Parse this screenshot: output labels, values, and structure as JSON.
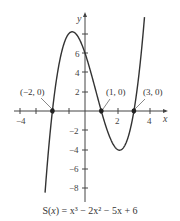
{
  "chart_data": {
    "type": "line",
    "title": "S(x) = x³ − 2x² − 5x + 6",
    "function": "x^3 - 2x^2 - 5x + 6",
    "xlabel": "x",
    "ylabel": "y",
    "xlim": [
      -4.3,
      4.8
    ],
    "ylim": [
      -9.5,
      9.8
    ],
    "x_ticks": [
      -4,
      -3,
      -2,
      -1,
      1,
      2,
      3,
      4
    ],
    "x_tick_labels": [
      "-4",
      "2",
      "4"
    ],
    "y_ticks": [
      -8,
      -6,
      -4,
      -2,
      2,
      4,
      6,
      8
    ],
    "y_tick_labels": [
      "-8",
      "-6",
      "-4",
      "-2",
      "2",
      "4",
      "6"
    ],
    "grid": false,
    "annotated_points": [
      {
        "label": "(−2, 0)",
        "x": -2,
        "y": 0
      },
      {
        "label": "(1, 0)",
        "x": 1,
        "y": 0
      },
      {
        "label": "(3, 0)",
        "x": 3,
        "y": 0
      }
    ],
    "series": [
      {
        "name": "S(x)",
        "x": [
          -2.3,
          -2,
          -1.5,
          -1,
          -0.79,
          -0.5,
          0,
          0.5,
          1,
          1.5,
          2,
          2.12,
          2.5,
          3,
          3.5,
          3.9
        ],
        "y": [
          -4.6,
          0,
          5.6,
          8.0,
          8.2,
          7.9,
          6.0,
          3.1,
          0,
          -2.6,
          -4.0,
          -4.1,
          -3.4,
          0,
          6.9,
          15.0
        ]
      }
    ]
  },
  "labels": {
    "x_axis": "x",
    "y_axis": "y",
    "tick_neg4": "−4",
    "tick_2": "2",
    "tick_4": "4",
    "ytick_2": "2",
    "ytick_4": "4",
    "ytick_6": "6",
    "ytick_neg2": "−2",
    "ytick_neg4": "−4",
    "ytick_neg6": "−6",
    "ytick_neg8": "−8",
    "pt1": "(−2, 0)",
    "pt2": "(1, 0)",
    "pt3": "(3, 0)"
  },
  "caption": {
    "prefix": "S(",
    "var": "x",
    "rest": ") = x³ − 2x² − 5x + 6"
  },
  "colors": {
    "curve": "#333333",
    "axis": "#444444"
  }
}
